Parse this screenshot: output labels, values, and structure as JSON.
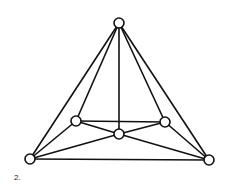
{
  "figure": {
    "label": "2.",
    "nodes": [
      {
        "id": "top",
        "x": 119,
        "y": 23
      },
      {
        "id": "mid-left",
        "x": 76,
        "y": 121
      },
      {
        "id": "mid-right",
        "x": 165,
        "y": 122
      },
      {
        "id": "center",
        "x": 119,
        "y": 134
      },
      {
        "id": "bottom-left",
        "x": 30,
        "y": 159
      },
      {
        "id": "bottom-right",
        "x": 209,
        "y": 160
      }
    ],
    "edges": [
      [
        "top",
        "bottom-left"
      ],
      [
        "top",
        "bottom-right"
      ],
      [
        "top",
        "mid-left"
      ],
      [
        "top",
        "mid-right"
      ],
      [
        "top",
        "center"
      ],
      [
        "mid-left",
        "mid-right"
      ],
      [
        "mid-left",
        "center"
      ],
      [
        "mid-left",
        "bottom-left"
      ],
      [
        "mid-right",
        "center"
      ],
      [
        "mid-right",
        "bottom-right"
      ],
      [
        "center",
        "bottom-left"
      ],
      [
        "center",
        "bottom-right"
      ],
      [
        "bottom-left",
        "bottom-right"
      ]
    ],
    "node_radius": 5,
    "stroke_color": "#111111",
    "node_fill": "#ffffff"
  }
}
